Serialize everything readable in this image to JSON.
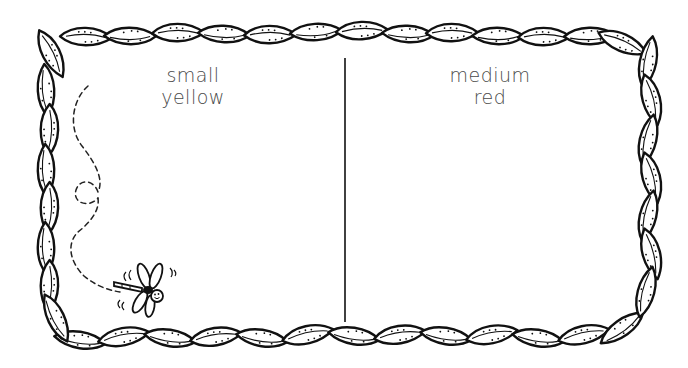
{
  "worksheet": {
    "left_panel": {
      "line1": "small",
      "line2": "yellow"
    },
    "right_panel": {
      "line1": "medium",
      "line2": "red"
    },
    "illustration": {
      "creature": "dragonfly-icon",
      "flight_path": "dashed-loop-path"
    },
    "border": "leaf-vine-frame",
    "colors": {
      "ink": "#111111",
      "text": "#4a4a4a",
      "background": "#ffffff"
    }
  }
}
